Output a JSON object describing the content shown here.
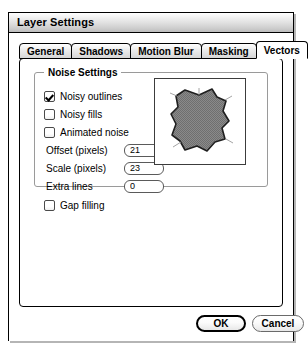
{
  "window": {
    "title": "Layer Settings"
  },
  "tabs": [
    {
      "label": "General",
      "selected": false
    },
    {
      "label": "Shadows",
      "selected": false
    },
    {
      "label": "Motion Blur",
      "selected": false
    },
    {
      "label": "Masking",
      "selected": false
    },
    {
      "label": "Vectors",
      "selected": true
    }
  ],
  "vectors_panel": {
    "noise_group": {
      "title": "Noise Settings",
      "checkboxes": [
        {
          "label": "Noisy outlines",
          "checked": true
        },
        {
          "label": "Noisy fills",
          "checked": false
        },
        {
          "label": "Animated noise",
          "checked": false
        }
      ],
      "fields": [
        {
          "label": "Offset (pixels)",
          "value": "21"
        },
        {
          "label": "Scale (pixels)",
          "value": "23"
        },
        {
          "label": "Extra lines",
          "value": "0"
        }
      ],
      "preview": {
        "name": "noisy-polygon-preview",
        "fill_color": "#808080",
        "outline_color": "#1a1a1a"
      }
    },
    "gap_filling": {
      "label": "Gap filling",
      "checked": false
    }
  },
  "buttons": {
    "ok": "OK",
    "cancel": "Cancel"
  }
}
